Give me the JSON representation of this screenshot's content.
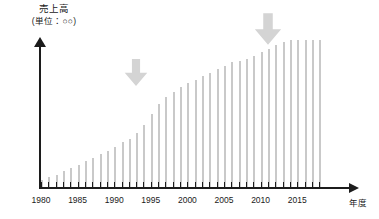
{
  "chart_data": {
    "type": "bar",
    "title": "売上高",
    "subtitle": "(単位：○○)",
    "ylabel": "売上高",
    "yunit": "(単位：○○)",
    "xlabel": "年度",
    "grid": false,
    "legend": null,
    "xlim": [
      1979,
      2019
    ],
    "ylim": [
      0,
      100
    ],
    "tick_labels": [
      "1980",
      "1985",
      "1990",
      "1995",
      "2000",
      "2005",
      "2010",
      "2015"
    ],
    "tick_years": [
      1980,
      1985,
      1990,
      1995,
      2000,
      2005,
      2010,
      2015
    ],
    "bar_color": "#c9c9c9",
    "axis_color": "#1c1c1c",
    "annotation_color": "#d4d4d4",
    "categories": [
      1980,
      1981,
      1982,
      1983,
      1984,
      1985,
      1986,
      1987,
      1988,
      1989,
      1990,
      1991,
      1992,
      1993,
      1994,
      1995,
      1996,
      1997,
      1998,
      1999,
      2000,
      2001,
      2002,
      2003,
      2004,
      2005,
      2006,
      2007,
      2008,
      2009,
      2010,
      2011,
      2012,
      2013,
      2014,
      2015,
      2016,
      2017,
      2018
    ],
    "values": [
      4,
      6,
      7,
      9,
      11,
      13,
      15,
      17,
      19,
      21,
      23,
      26,
      28,
      31,
      36,
      42,
      48,
      52,
      55,
      58,
      60,
      62,
      64,
      66,
      68,
      70,
      72,
      73,
      74,
      76,
      78,
      80,
      82,
      84,
      85,
      85,
      85,
      85,
      85
    ],
    "annotations": [
      {
        "name": "first-inflection-arrow",
        "icon": "arrow-down-icon",
        "label": "",
        "year": 1993,
        "note": "成長加速地点を指す下向き矢印"
      },
      {
        "name": "second-inflection-arrow",
        "icon": "arrow-down-icon",
        "label": "",
        "year": 2011,
        "note": "横ばい開始地点を指す下向き矢印"
      }
    ]
  }
}
